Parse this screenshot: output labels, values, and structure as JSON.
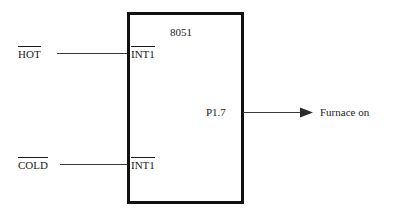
{
  "diagram": {
    "chip": {
      "name": "8051",
      "pins": {
        "int1_top": "INT1",
        "int1_bottom": "INT1",
        "p17": "P1.7"
      }
    },
    "inputs": [
      {
        "label": "HOT",
        "active_low": true
      },
      {
        "label": "COLD",
        "active_low": true
      }
    ],
    "output": {
      "label": "Furnace on",
      "arrow": "arrow-right"
    },
    "colors": {
      "chip_border": "#111111",
      "chip_fill": "#ffffff",
      "wire": "#3b3b3b",
      "text": "#1a1a1a",
      "background": "#ffffff"
    }
  }
}
